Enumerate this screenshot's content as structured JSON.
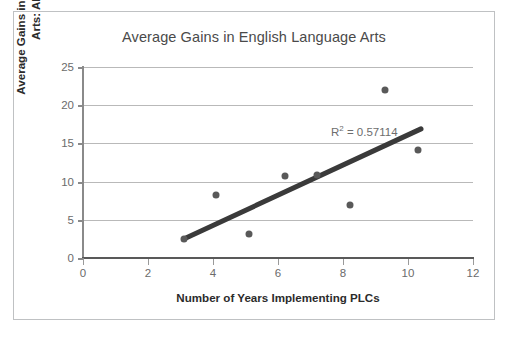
{
  "chart_data": {
    "type": "scatter",
    "title": "Average Gains in English Language Arts",
    "xlabel": "Number of Years Implementing PLCs",
    "ylabel_line1": "Average Gains in English Language",
    "ylabel_line2": "Arts: All Grades",
    "xlim": [
      0,
      12
    ],
    "ylim": [
      0,
      25
    ],
    "xticks": [
      0,
      2,
      4,
      6,
      8,
      10,
      12
    ],
    "yticks": [
      0,
      5,
      10,
      15,
      20,
      25
    ],
    "grid": "horizontal",
    "legend": "none",
    "points": [
      {
        "x": 3.1,
        "y": 2.5
      },
      {
        "x": 4.1,
        "y": 8.3
      },
      {
        "x": 5.1,
        "y": 3.2
      },
      {
        "x": 6.2,
        "y": 10.7
      },
      {
        "x": 7.2,
        "y": 10.9
      },
      {
        "x": 8.2,
        "y": 7.0
      },
      {
        "x": 9.3,
        "y": 22.0
      },
      {
        "x": 10.3,
        "y": 14.2
      }
    ],
    "trendline": {
      "x1": 3.1,
      "y1": 2.5,
      "x2": 10.4,
      "y2": 16.9,
      "color": "#3a3a3a"
    },
    "annotation": {
      "prefix": "R",
      "superscript": "2",
      "suffix": " = 0.57114"
    },
    "point_color": "#595959",
    "grid_color": "#b9b9b9",
    "axis_color": "#595959"
  }
}
